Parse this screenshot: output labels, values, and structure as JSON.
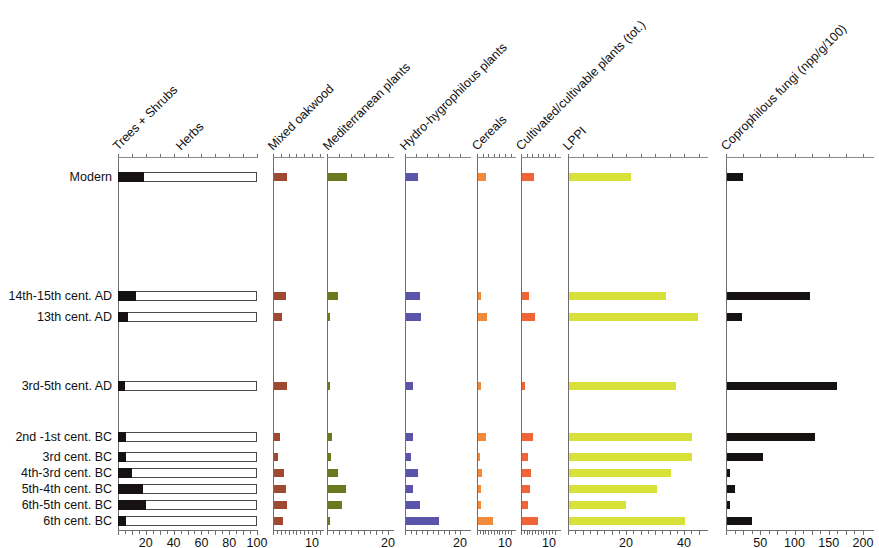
{
  "chart_data": {
    "type": "bar",
    "title": "",
    "subtitle": "",
    "orientation": "horizontal",
    "layout": "multi-panel pollen diagram (stratigraphic)",
    "grid": false,
    "legend": "none",
    "ylabel": "Chronological phase",
    "categories": [
      "Modern",
      "14th-15th cent. AD",
      "13th cent. AD",
      "3rd-5th cent. AD",
      "2nd -1st cent. BC",
      "3rd cent. BC",
      "4th-3rd cent. BC",
      "5th-4th cent. BC",
      "6th-5th cent. BC",
      "6th cent. BC"
    ],
    "panels": [
      {
        "name": "trees-shrubs-herbs",
        "headers": [
          "Trees + Shrubs",
          "Herbs"
        ],
        "xlabel": "%",
        "xlim": [
          0,
          100
        ],
        "ticks": [
          0,
          10,
          20,
          30,
          40,
          50,
          60,
          70,
          80,
          90,
          100
        ],
        "tick_labels": [
          {
            "v": 20,
            "t": "20"
          },
          {
            "v": 40,
            "t": "40"
          },
          {
            "v": 60,
            "t": "60"
          },
          {
            "v": 80,
            "t": "80"
          },
          {
            "v": 100,
            "t": "100"
          }
        ],
        "style": "stacked",
        "color": "#161212",
        "color2": "#ffffff",
        "values": [
          19,
          13,
          7,
          5,
          6,
          6,
          10,
          18,
          20,
          6
        ]
      },
      {
        "name": "mixed-oakwood",
        "headers": [
          "Mixed oakwood"
        ],
        "xlabel": "%",
        "xlim": [
          0,
          13
        ],
        "ticks": [
          0,
          2,
          4,
          6,
          8,
          10,
          12
        ],
        "tick_labels": [
          {
            "v": 10,
            "t": "10"
          }
        ],
        "style": "bar",
        "color": "#9e4a33",
        "values": [
          3.3,
          3.2,
          2.0,
          3.4,
          1.6,
          1.0,
          2.6,
          3.2,
          3.4,
          2.4
        ]
      },
      {
        "name": "mediterranean-plants",
        "headers": [
          "Mediterranean plants"
        ],
        "xlabel": "%",
        "xlim": [
          0,
          22
        ],
        "ticks": [
          0,
          4,
          8,
          12,
          16,
          20
        ],
        "tick_labels": [
          {
            "v": 20,
            "t": "20"
          }
        ],
        "style": "bar",
        "color": "#6b7a1e",
        "values": [
          6.2,
          3.2,
          0.7,
          0.3,
          1.4,
          1.1,
          3.4,
          5.8,
          4.6,
          0.5
        ]
      },
      {
        "name": "hydro-hygrophilous-plants",
        "headers": [
          "Hydro-hygrophilous plants"
        ],
        "xlabel": "%",
        "xlim": [
          0,
          24
        ],
        "ticks": [
          0,
          4,
          8,
          12,
          16,
          20
        ],
        "tick_labels": [
          {
            "v": 20,
            "t": "20"
          }
        ],
        "style": "bar",
        "color": "#5a55a8",
        "values": [
          4.4,
          5.2,
          5.6,
          2.5,
          2.5,
          1.8,
          4.5,
          2.4,
          5.0,
          12.0
        ]
      },
      {
        "name": "cereals",
        "headers": [
          "Cereals"
        ],
        "xlabel": "%",
        "xlim": [
          0,
          14
        ],
        "ticks": [
          0,
          2,
          4,
          6,
          8,
          10,
          12
        ],
        "tick_labels": [
          {
            "v": 10,
            "t": "10"
          }
        ],
        "style": "bar",
        "color": "#f08a3c",
        "values": [
          3.0,
          1.0,
          3.1,
          1.0,
          3.0,
          0.8,
          1.3,
          1.2,
          1.1,
          5.5
        ]
      },
      {
        "name": "cultivated-cultivable-plants",
        "headers": [
          "Cultivated/cultivable plants (tot.)"
        ],
        "xlabel": "%",
        "xlim": [
          0,
          14
        ],
        "ticks": [
          0,
          2,
          4,
          6,
          8,
          10,
          12
        ],
        "tick_labels": [
          {
            "v": 10,
            "t": "10"
          }
        ],
        "style": "bar",
        "color": "#ef6536",
        "values": [
          4.2,
          2.4,
          4.6,
          1.2,
          4.0,
          2.0,
          3.1,
          2.7,
          2.2,
          5.6
        ]
      },
      {
        "name": "lppi",
        "headers": [
          "LPPI"
        ],
        "xlabel": "%",
        "xlim": [
          0,
          48
        ],
        "ticks": [
          0,
          5,
          10,
          15,
          20,
          25,
          30,
          35,
          40,
          45
        ],
        "tick_labels": [
          {
            "v": 20,
            "t": "20"
          },
          {
            "v": 40,
            "t": "40"
          }
        ],
        "style": "bar",
        "color": "#d8e03a",
        "values": [
          21.5,
          33.5,
          44.5,
          37.0,
          42.5,
          42.5,
          35.0,
          30.5,
          19.5,
          40.0
        ]
      },
      {
        "name": "coprophilous-fungi",
        "headers": [
          "Coprophilous fungi (npp/g/100)"
        ],
        "xlabel": "npp/g/100",
        "xlim": [
          0,
          215
        ],
        "ticks": [
          0,
          25,
          50,
          75,
          100,
          125,
          150,
          175,
          200
        ],
        "tick_labels": [
          {
            "v": 50,
            "t": "50"
          },
          {
            "v": 100,
            "t": "100"
          },
          {
            "v": 150,
            "t": "150"
          },
          {
            "v": 200,
            "t": "200"
          }
        ],
        "style": "bar",
        "color": "#161212",
        "values": [
          24,
          121,
          22,
          160,
          128,
          52,
          4,
          12,
          4,
          36
        ]
      }
    ]
  },
  "colors": {
    "axis": "#6e6e6e",
    "text": "#111111",
    "trees": "#161212",
    "herbs": "#ffffff",
    "mixed_oakwood": "#9e4a33",
    "mediterranean": "#6b7a1e",
    "hydro": "#5a55a8",
    "cereals": "#f08a3c",
    "cultivated": "#ef6536",
    "lppi": "#d8e03a",
    "coprophilous": "#161212"
  }
}
